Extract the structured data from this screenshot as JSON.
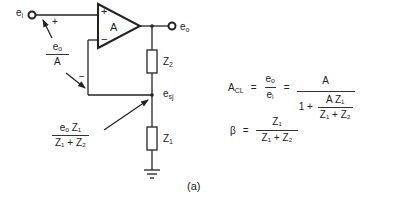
{
  "circuit": {
    "input_terminal": {
      "label": "e",
      "sub": "i"
    },
    "output_terminal": {
      "label": "e",
      "sub": "o"
    },
    "opamp": {
      "gain_label": "A",
      "plus": "+",
      "minus": "−"
    },
    "input_sign": "+",
    "feedback_sign": "−",
    "resistor_top": {
      "label": "Z",
      "sub": "2"
    },
    "resistor_bottom": {
      "label": "Z",
      "sub": "1"
    },
    "summing_junction": {
      "label": "e",
      "sub": "sj"
    },
    "ground": "ground-symbol",
    "annotation_error": {
      "num": "eₒ",
      "den": "A"
    },
    "annotation_divider": {
      "num": "eₒ Z₁",
      "den": "Z₁ + Z₂"
    }
  },
  "equations": {
    "closed_loop": {
      "lhs": "A",
      "lhs_sub": "CL",
      "eq1": "=",
      "ratio_num": "eₒ",
      "ratio_den": "eᵢ",
      "eq2": "=",
      "rhs_num": "A",
      "rhs_den_prefix": "1 +",
      "rhs_den_num": "A Z₁",
      "rhs_den_den": "Z₁ + Z₂"
    },
    "beta": {
      "lhs": "β",
      "eq": "=",
      "num": "Z₁",
      "den": "Z₁ + Z₂"
    }
  },
  "caption": "(a)"
}
